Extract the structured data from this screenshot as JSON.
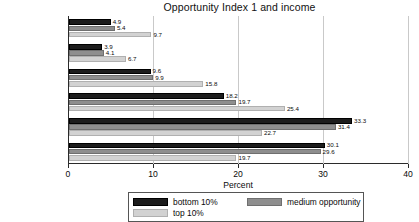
{
  "chart_data": {
    "type": "bar",
    "orientation": "horizontal",
    "title": "Opportunity Index 1 and income",
    "xlabel": "Percent",
    "ylabel": "",
    "xlim": [
      0,
      40
    ],
    "xticks": [
      0,
      10,
      20,
      30,
      40
    ],
    "xtick_labels": [
      "0",
      "10",
      "20",
      "30",
      "40"
    ],
    "grid": true,
    "legend_position": "bottom",
    "categories": [
      "> $6060",
      "$4845–$6060",
      "$3630–$4845",
      "$2430–$3630",
      "$1220–$2430",
      "<$1220"
    ],
    "series": [
      {
        "name": "bottom 10%",
        "color": "#1c1c1c",
        "values": [
          4.9,
          3.9,
          9.6,
          18.2,
          33.3,
          30.1
        ]
      },
      {
        "name": "medium opportunity",
        "color": "#8e8e8e",
        "values": [
          5.4,
          4.1,
          9.9,
          19.7,
          31.4,
          29.6
        ]
      },
      {
        "name": "top 10%",
        "color": "#d2d2d2",
        "values": [
          9.7,
          6.7,
          15.8,
          25.4,
          22.7,
          19.7
        ]
      }
    ]
  }
}
